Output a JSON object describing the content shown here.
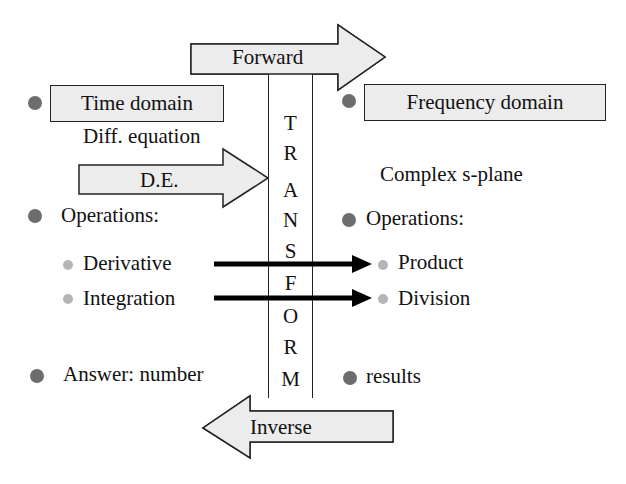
{
  "arrows": {
    "forward": "Forward",
    "inverse": "Inverse",
    "de": "D.E."
  },
  "transform": {
    "letters": [
      "T",
      "R",
      "A",
      "N",
      "S",
      "F",
      "O",
      "R",
      "M"
    ]
  },
  "left": {
    "title": "Time domain",
    "subtitle": "Diff. equation",
    "operations_label": "Operations:",
    "operations": [
      "Derivative",
      "Integration"
    ],
    "answer": "Answer: number"
  },
  "right": {
    "title": "Frequency domain",
    "subtitle": "Complex s-plane",
    "operations_label": "Operations:",
    "operations": [
      "Product",
      "Division"
    ],
    "answer": "results"
  },
  "colors": {
    "box_fill": "#ececec",
    "bullet_main": "#6d6d6d",
    "bullet_sub": "#b5b5b5",
    "stroke": "#222222"
  }
}
